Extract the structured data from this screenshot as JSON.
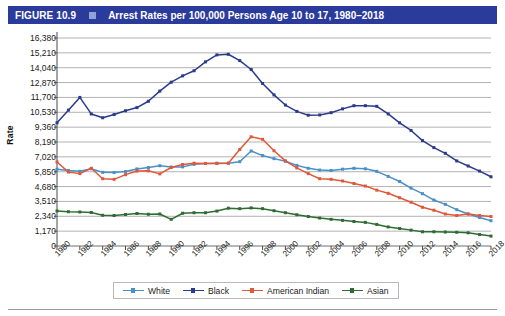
{
  "header": {
    "figure_number": "FIGURE 10.9",
    "square_icon": "square-bullet-icon",
    "title": "Arrest Rates per 100,000 Persons Age 10 to 17, 1980–2018",
    "bar_color": "#2b3b9b",
    "square_color": "#8fa3d8",
    "text_color": "#ffffff"
  },
  "chart_data": {
    "type": "line",
    "title": "Arrest Rates per 100,000 Persons Age 10 to 17, 1980–2018",
    "xlabel": "",
    "ylabel": "Rate",
    "ylim": [
      0,
      16380
    ],
    "ytick_step": 1170,
    "yticks": [
      0,
      1170,
      2340,
      3510,
      4680,
      5850,
      7020,
      8190,
      9360,
      10530,
      11700,
      12870,
      14040,
      15210,
      16380
    ],
    "ytick_labels": [
      "0",
      "1,170",
      "2,340",
      "3,510",
      "4,680",
      "5,850",
      "7,020",
      "8,190",
      "9,360",
      "10,530",
      "11,700",
      "12,870",
      "14,040",
      "15,210",
      "16,380"
    ],
    "grid": true,
    "grid_axis": "y",
    "legend_position": "bottom",
    "x": [
      1980,
      1981,
      1982,
      1983,
      1984,
      1985,
      1986,
      1987,
      1988,
      1989,
      1990,
      1991,
      1992,
      1993,
      1994,
      1995,
      1996,
      1997,
      1998,
      1999,
      2000,
      2001,
      2002,
      2003,
      2004,
      2005,
      2006,
      2007,
      2008,
      2009,
      2010,
      2011,
      2012,
      2013,
      2014,
      2015,
      2016,
      2017,
      2018
    ],
    "xtick_labels": [
      "1980",
      "1982",
      "1984",
      "1986",
      "1988",
      "1990",
      "1992",
      "1994",
      "1996",
      "1998",
      "2000",
      "2002",
      "2004",
      "2006",
      "2008",
      "2010",
      "2012",
      "2014",
      "2016",
      "2018"
    ],
    "xtick_rotation": -45,
    "series": [
      {
        "name": "White",
        "color": "#4a90c8",
        "marker": "square",
        "values": [
          6050,
          5950,
          5880,
          6080,
          5800,
          5790,
          5860,
          6070,
          6180,
          6320,
          6220,
          6230,
          6430,
          6500,
          6520,
          6520,
          6640,
          7480,
          7120,
          6880,
          6680,
          6350,
          6120,
          5980,
          5950,
          6050,
          6120,
          6080,
          5880,
          5480,
          5080,
          4560,
          4120,
          3620,
          3280,
          2860,
          2520,
          2240,
          1990
        ]
      },
      {
        "name": "Black",
        "color": "#2b3b8c",
        "marker": "square",
        "values": [
          9700,
          10700,
          11700,
          10400,
          10100,
          10350,
          10650,
          10900,
          11400,
          12200,
          12900,
          13400,
          13800,
          14500,
          15050,
          15100,
          14600,
          13900,
          12800,
          11900,
          11100,
          10600,
          10300,
          10320,
          10500,
          10800,
          11050,
          11050,
          11000,
          10400,
          9700,
          9100,
          8300,
          7750,
          7300,
          6700,
          6300,
          5900,
          5450
        ]
      },
      {
        "name": "American Indian",
        "color": "#e0583a",
        "marker": "square",
        "values": [
          6620,
          5820,
          5700,
          6120,
          5300,
          5250,
          5620,
          5900,
          5920,
          5680,
          6180,
          6420,
          6520,
          6500,
          6500,
          6520,
          7600,
          8600,
          8400,
          7500,
          6700,
          6150,
          5700,
          5300,
          5250,
          5120,
          4920,
          4720,
          4400,
          4150,
          3800,
          3450,
          3050,
          2820,
          2520,
          2400,
          2520,
          2400,
          2320
        ]
      },
      {
        "name": "Asian",
        "color": "#2e6b33",
        "marker": "square",
        "values": [
          2760,
          2700,
          2680,
          2640,
          2420,
          2400,
          2480,
          2560,
          2500,
          2520,
          2100,
          2580,
          2620,
          2620,
          2750,
          2980,
          2940,
          3000,
          2940,
          2780,
          2620,
          2460,
          2320,
          2200,
          2100,
          2020,
          1930,
          1860,
          1700,
          1500,
          1380,
          1250,
          1120,
          1120,
          1100,
          1080,
          1040,
          900,
          780
        ]
      }
    ]
  },
  "legend": {
    "items": [
      {
        "label": "White",
        "color": "#4a90c8"
      },
      {
        "label": "Black",
        "color": "#2b3b8c"
      },
      {
        "label": "American Indian",
        "color": "#e0583a"
      },
      {
        "label": "Asian",
        "color": "#2e6b33"
      }
    ]
  }
}
